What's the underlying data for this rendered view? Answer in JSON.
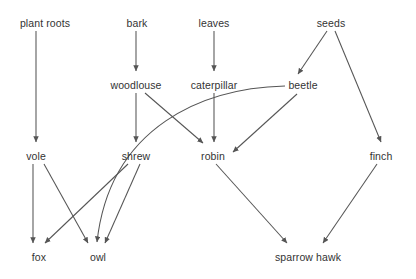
{
  "diagram": {
    "type": "food-web-directed-graph",
    "title": "",
    "width": 416,
    "height": 279,
    "background_color": "#ffffff",
    "edge_color": "#555555",
    "label_color": "#333333",
    "nodes": [
      {
        "id": "plant-roots",
        "label": "plant roots",
        "x": 45,
        "y": 25
      },
      {
        "id": "bark",
        "label": "bark",
        "x": 137,
        "y": 25
      },
      {
        "id": "leaves",
        "label": "leaves",
        "x": 214,
        "y": 25
      },
      {
        "id": "seeds",
        "label": "seeds",
        "x": 331,
        "y": 25
      },
      {
        "id": "woodlouse",
        "label": "woodlouse",
        "x": 136,
        "y": 87
      },
      {
        "id": "caterpillar",
        "label": "caterpillar",
        "x": 214,
        "y": 87
      },
      {
        "id": "beetle",
        "label": "beetle",
        "x": 303,
        "y": 87
      },
      {
        "id": "vole",
        "label": "vole",
        "x": 36,
        "y": 158
      },
      {
        "id": "shrew",
        "label": "shrew",
        "x": 136,
        "y": 158
      },
      {
        "id": "robin",
        "label": "robin",
        "x": 213,
        "y": 158
      },
      {
        "id": "finch",
        "label": "finch",
        "x": 381,
        "y": 158
      },
      {
        "id": "fox",
        "label": "fox",
        "x": 39,
        "y": 260
      },
      {
        "id": "owl",
        "label": "owl",
        "x": 98,
        "y": 260
      },
      {
        "id": "sparrow-hawk",
        "label": "sparrow hawk",
        "x": 308,
        "y": 260
      }
    ],
    "edges": [
      {
        "id": "plant-roots-to-vole",
        "from": "plant roots",
        "to": "vole",
        "shape": "straight"
      },
      {
        "id": "bark-to-woodlouse",
        "from": "bark",
        "to": "woodlouse",
        "shape": "straight"
      },
      {
        "id": "leaves-to-caterpillar",
        "from": "leaves",
        "to": "caterpillar",
        "shape": "straight"
      },
      {
        "id": "seeds-to-beetle",
        "from": "seeds",
        "to": "beetle",
        "shape": "straight"
      },
      {
        "id": "seeds-to-finch",
        "from": "seeds",
        "to": "finch",
        "shape": "straight"
      },
      {
        "id": "woodlouse-to-shrew",
        "from": "woodlouse",
        "to": "shrew",
        "shape": "straight"
      },
      {
        "id": "woodlouse-to-robin",
        "from": "woodlouse",
        "to": "robin",
        "shape": "straight"
      },
      {
        "id": "caterpillar-to-robin",
        "from": "caterpillar",
        "to": "robin",
        "shape": "straight"
      },
      {
        "id": "beetle-to-robin",
        "from": "beetle",
        "to": "robin",
        "shape": "straight"
      },
      {
        "id": "beetle-to-owl",
        "from": "beetle",
        "to": "owl",
        "shape": "curved"
      },
      {
        "id": "vole-to-fox",
        "from": "vole",
        "to": "fox",
        "shape": "straight"
      },
      {
        "id": "vole-to-owl",
        "from": "vole",
        "to": "owl",
        "shape": "straight"
      },
      {
        "id": "shrew-to-fox",
        "from": "shrew",
        "to": "fox",
        "shape": "straight"
      },
      {
        "id": "shrew-to-owl",
        "from": "shrew",
        "to": "owl",
        "shape": "straight"
      },
      {
        "id": "robin-to-sparrow-hawk",
        "from": "robin",
        "to": "sparrow hawk",
        "shape": "straight"
      },
      {
        "id": "finch-to-sparrow-hawk",
        "from": "finch",
        "to": "sparrow hawk",
        "shape": "straight"
      }
    ]
  }
}
